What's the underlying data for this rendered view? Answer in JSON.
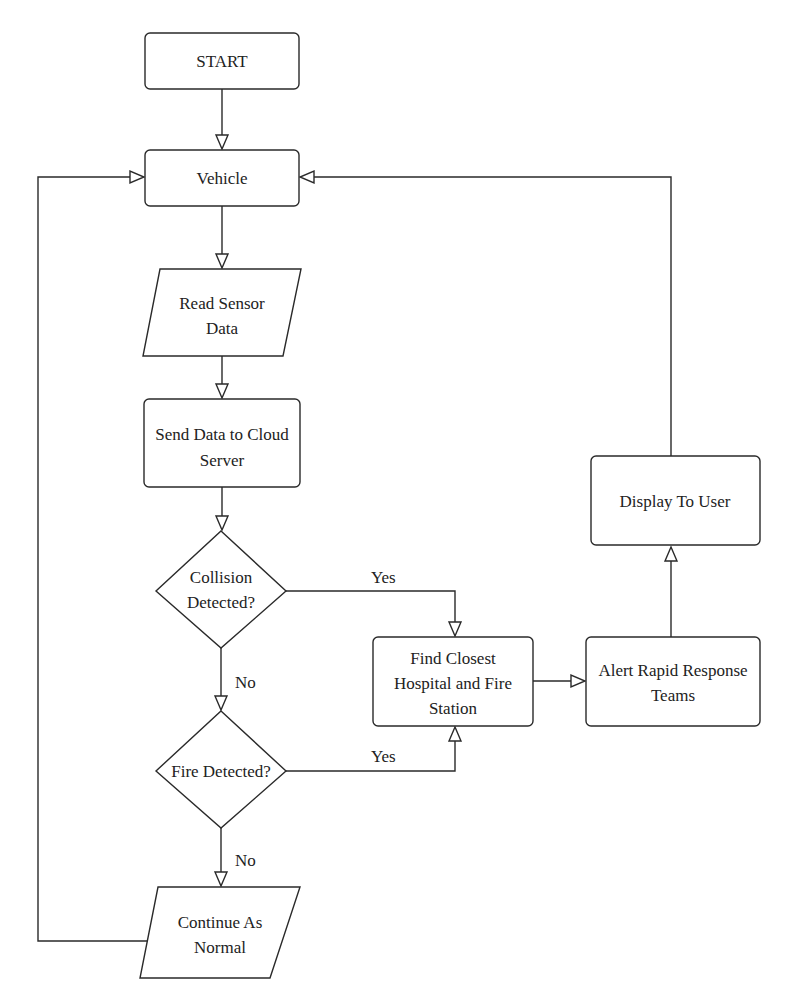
{
  "diagram": {
    "type": "flowchart",
    "nodes": {
      "start": {
        "shape": "rounded-rect",
        "lines": [
          "START"
        ]
      },
      "vehicle": {
        "shape": "rounded-rect",
        "lines": [
          "Vehicle"
        ]
      },
      "read_sensor": {
        "shape": "parallelogram",
        "lines": [
          "Read Sensor",
          "Data"
        ]
      },
      "send_data": {
        "shape": "rounded-rect",
        "lines": [
          "Send Data to Cloud",
          "Server"
        ]
      },
      "collision": {
        "shape": "diamond",
        "lines": [
          "Collision",
          "Detected?"
        ]
      },
      "fire": {
        "shape": "diamond",
        "lines": [
          "Fire Detected?"
        ]
      },
      "continue": {
        "shape": "parallelogram",
        "lines": [
          "Continue As",
          "Normal"
        ]
      },
      "find_closest": {
        "shape": "rounded-rect",
        "lines": [
          "Find Closest",
          "Hospital and Fire",
          "Station"
        ]
      },
      "alert": {
        "shape": "rounded-rect",
        "lines": [
          "Alert Rapid Response",
          "Teams"
        ]
      },
      "display": {
        "shape": "rounded-rect",
        "lines": [
          "Display To User"
        ]
      }
    },
    "edges": [
      {
        "from": "start",
        "to": "vehicle",
        "label": ""
      },
      {
        "from": "vehicle",
        "to": "read_sensor",
        "label": ""
      },
      {
        "from": "read_sensor",
        "to": "send_data",
        "label": ""
      },
      {
        "from": "send_data",
        "to": "collision",
        "label": ""
      },
      {
        "from": "collision",
        "to": "find_closest",
        "label": "Yes"
      },
      {
        "from": "collision",
        "to": "fire",
        "label": "No"
      },
      {
        "from": "fire",
        "to": "find_closest",
        "label": "Yes"
      },
      {
        "from": "fire",
        "to": "continue",
        "label": "No"
      },
      {
        "from": "continue",
        "to": "vehicle",
        "label": ""
      },
      {
        "from": "find_closest",
        "to": "alert",
        "label": ""
      },
      {
        "from": "alert",
        "to": "display",
        "label": ""
      },
      {
        "from": "display",
        "to": "vehicle",
        "label": ""
      }
    ],
    "edge_labels": {
      "collision_yes": "Yes",
      "collision_no": "No",
      "fire_yes": "Yes",
      "fire_no": "No"
    },
    "colors": {
      "stroke": "#2a2a2a",
      "fill": "#ffffff",
      "text": "#222222"
    }
  }
}
